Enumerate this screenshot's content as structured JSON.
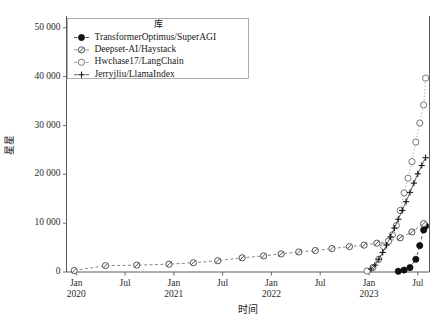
{
  "chart_data": {
    "type": "line",
    "title": "",
    "xlabel": "时间",
    "ylabel": "星星",
    "ylim": [
      0,
      52000
    ],
    "yticks": [
      0,
      10000,
      20000,
      30000,
      40000,
      50000
    ],
    "ytick_labels": [
      "0",
      "10 000",
      "20 000",
      "30 000",
      "40 000",
      "50 000"
    ],
    "xtick_labels": [
      "Jan\n2020",
      "Jul",
      "Jan\n2021",
      "Jul",
      "Jan\n2022",
      "Jul",
      "Jan\n2023",
      "Jul"
    ],
    "xticks_major": [
      "Jan",
      "Jul",
      "Jan",
      "Jul",
      "Jan",
      "Jul",
      "Jan",
      "Jul"
    ],
    "xticks_year": [
      "2020",
      "",
      "2021",
      "",
      "2022",
      "",
      "2023",
      ""
    ],
    "xlim": [
      2019.9,
      2023.62
    ],
    "grid": false,
    "legend_position": "upper-left",
    "legend_title": "库",
    "series": [
      {
        "name": "TransformerOptimus/SuperAGI",
        "marker": "filled-circle",
        "color": "#111111",
        "linestyle": "dashed",
        "x": [
          2023.3,
          2023.36,
          2023.42,
          2023.48,
          2023.52,
          2023.56,
          2023.58
        ],
        "values": [
          150,
          400,
          900,
          2600,
          5400,
          8600,
          9400
        ]
      },
      {
        "name": "Deepset-AI/Haystack",
        "marker": "slashed-circle",
        "color": "#555555",
        "linestyle": "dashed",
        "x": [
          2019.98,
          2020.3,
          2020.62,
          2020.95,
          2021.2,
          2021.45,
          2021.7,
          2021.92,
          2022.1,
          2022.28,
          2022.45,
          2022.62,
          2022.8,
          2022.95,
          2023.08,
          2023.2,
          2023.32,
          2023.44,
          2023.56
        ],
        "values": [
          300,
          1300,
          1400,
          1600,
          1900,
          2300,
          2900,
          3300,
          3700,
          4100,
          4400,
          4800,
          5200,
          5500,
          5900,
          6300,
          7000,
          8200,
          9900
        ]
      },
      {
        "name": "Hwchase17/LangChain",
        "marker": "open-circle",
        "color": "#777777",
        "linestyle": "dotted",
        "x": [
          2022.98,
          2023.04,
          2023.1,
          2023.15,
          2023.2,
          2023.24,
          2023.28,
          2023.32,
          2023.36,
          2023.4,
          2023.44,
          2023.48,
          2023.52,
          2023.56,
          2023.58
        ],
        "values": [
          200,
          900,
          2600,
          5200,
          6300,
          7600,
          9500,
          12600,
          16200,
          19200,
          22600,
          26600,
          30500,
          34200,
          39700
        ]
      },
      {
        "name": "Jerryjliu/LlamaIndex",
        "marker": "plus",
        "color": "#161616",
        "linestyle": "solid",
        "x": [
          2023.02,
          2023.06,
          2023.1,
          2023.14,
          2023.18,
          2023.22,
          2023.26,
          2023.3,
          2023.34,
          2023.38,
          2023.42,
          2023.46,
          2023.5,
          2023.54,
          2023.58
        ],
        "values": [
          600,
          1400,
          2600,
          4000,
          5500,
          7200,
          9000,
          10800,
          12600,
          14400,
          16300,
          18200,
          20100,
          21800,
          23400
        ]
      }
    ]
  },
  "legend": {
    "title": "库",
    "entries": [
      {
        "label": "TransformerOptimus/SuperAGI",
        "marker": "filled-circle"
      },
      {
        "label": "Deepset-AI/Haystack",
        "marker": "slashed-circle"
      },
      {
        "label": "Hwchase17/LangChain",
        "marker": "open-circle"
      },
      {
        "label": "Jerryjliu/LlamaIndex",
        "marker": "plus"
      }
    ]
  },
  "axes": {
    "y_title": "星星",
    "x_title": "时间"
  }
}
